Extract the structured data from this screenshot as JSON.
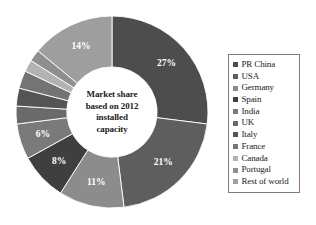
{
  "figure": {
    "name": "wind-power-market-share-donut-chart",
    "background": "#ffffff"
  },
  "center_text": {
    "line1": "Market share",
    "line2": "based on 2012",
    "line3": "installed",
    "line4": "capacity"
  },
  "legend": {
    "position": "right",
    "border_color": "#7d7d7d",
    "items": [
      {
        "label": "PR China",
        "color": "#4d4d4d"
      },
      {
        "label": "USA",
        "color": "#5e5e5e"
      },
      {
        "label": "Germany",
        "color": "#8c8c8c"
      },
      {
        "label": "Spain",
        "color": "#3f3f3f"
      },
      {
        "label": "India",
        "color": "#7a7a7a"
      },
      {
        "label": "UK",
        "color": "#6a6a6a"
      },
      {
        "label": "Italy",
        "color": "#545454"
      },
      {
        "label": "France",
        "color": "#747474"
      },
      {
        "label": "Canada",
        "color": "#b2b2b2"
      },
      {
        "label": "Portugal",
        "color": "#8f8f8f"
      },
      {
        "label": "Rest of world",
        "color": "#9e9e9e"
      }
    ]
  },
  "chart_data": {
    "type": "pie",
    "variant": "donut",
    "title": "Market share based on 2012 installed capacity",
    "xlabel": "",
    "ylabel": "",
    "units": "percent",
    "start_angle_deg": 0,
    "direction": "clockwise",
    "inner_radius_ratio": 0.47,
    "grid": false,
    "legend_position": "right",
    "categories": [
      "PR China",
      "USA",
      "Germany",
      "Spain",
      "India",
      "UK",
      "Italy",
      "France",
      "Canada",
      "Portugal",
      "Rest of world"
    ],
    "values": [
      27,
      21,
      11,
      8,
      6,
      3,
      3,
      3,
      2,
      2,
      14
    ],
    "data_labels": [
      "27%",
      "21%",
      "11%",
      "8%",
      "6%",
      "3%",
      "3%",
      "3%",
      "2%",
      "2%",
      "14%"
    ],
    "colors": [
      "#4d4d4d",
      "#5e5e5e",
      "#8c8c8c",
      "#3f3f3f",
      "#7a7a7a",
      "#6a6a6a",
      "#545454",
      "#747474",
      "#b2b2b2",
      "#8f8f8f",
      "#9e9e9e"
    ],
    "slices": [
      {
        "label": "PR China",
        "value": 27,
        "data_label": "27%",
        "color": "#4d4d4d"
      },
      {
        "label": "USA",
        "value": 21,
        "data_label": "21%",
        "color": "#5e5e5e"
      },
      {
        "label": "Germany",
        "value": 11,
        "data_label": "11%",
        "color": "#8c8c8c"
      },
      {
        "label": "Spain",
        "value": 8,
        "data_label": "8%",
        "color": "#3f3f3f"
      },
      {
        "label": "India",
        "value": 6,
        "data_label": "6%",
        "color": "#7a7a7a"
      },
      {
        "label": "UK",
        "value": 3,
        "data_label": "3%",
        "color": "#6a6a6a"
      },
      {
        "label": "Italy",
        "value": 3,
        "data_label": "3%",
        "color": "#545454"
      },
      {
        "label": "France",
        "value": 3,
        "data_label": "3%",
        "color": "#747474"
      },
      {
        "label": "Canada",
        "value": 2,
        "data_label": "2%",
        "color": "#b2b2b2"
      },
      {
        "label": "Portugal",
        "value": 2,
        "data_label": "2%",
        "color": "#8f8f8f"
      },
      {
        "label": "Rest of world",
        "value": 14,
        "data_label": "14%",
        "color": "#9e9e9e"
      }
    ],
    "total": 100
  }
}
